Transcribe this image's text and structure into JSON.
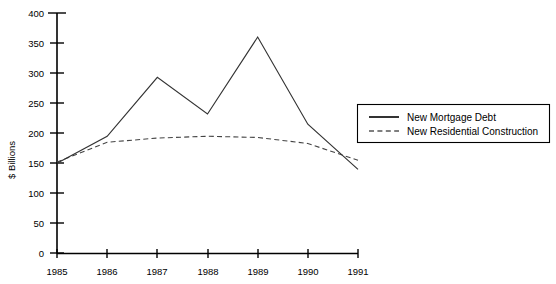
{
  "chart_data": {
    "type": "line",
    "title": "",
    "xlabel": "",
    "ylabel": "$ Billions",
    "categories": [
      "1985",
      "1986",
      "1987",
      "1988",
      "1989",
      "1990",
      "1991"
    ],
    "x": [
      1985,
      1986,
      1987,
      1988,
      1989,
      1990,
      1991
    ],
    "series": [
      {
        "name": "New Mortgage Debt",
        "style": "solid",
        "color": "#333333",
        "values": [
          150,
          195,
          293,
          232,
          360,
          215,
          140
        ]
      },
      {
        "name": "New Residential Construction",
        "style": "dashed",
        "color": "#444444",
        "values": [
          152,
          185,
          192,
          195,
          193,
          183,
          155
        ]
      }
    ],
    "ylim": [
      0,
      400
    ],
    "xlim": [
      1985,
      1991
    ],
    "ytick_step": 50,
    "yticks": [
      0,
      50,
      100,
      150,
      200,
      250,
      300,
      350,
      400
    ],
    "ytick_labels": [
      "0",
      "50",
      "100",
      "150",
      "200",
      "250",
      "300",
      "350",
      "400"
    ],
    "xtick_labels": [
      "1985",
      "1986",
      "1987",
      "1988",
      "1989",
      "1990",
      "1991"
    ],
    "grid": false,
    "legend_position": "right"
  },
  "axes": {
    "y_title": "$ Billions",
    "y_ticks": [
      {
        "label": "400"
      },
      {
        "label": "350"
      },
      {
        "label": "300"
      },
      {
        "label": "250"
      },
      {
        "label": "200"
      },
      {
        "label": "150"
      },
      {
        "label": "100"
      },
      {
        "label": "50"
      },
      {
        "label": "0"
      }
    ],
    "x_ticks": [
      {
        "label": "1985"
      },
      {
        "label": "1986"
      },
      {
        "label": "1987"
      },
      {
        "label": "1988"
      },
      {
        "label": "1989"
      },
      {
        "label": "1990"
      },
      {
        "label": "1991"
      }
    ]
  },
  "legend": {
    "entries": [
      {
        "label": "New Mortgage Debt",
        "style": "solid"
      },
      {
        "label": "New Residential Construction",
        "style": "dashed"
      }
    ]
  }
}
